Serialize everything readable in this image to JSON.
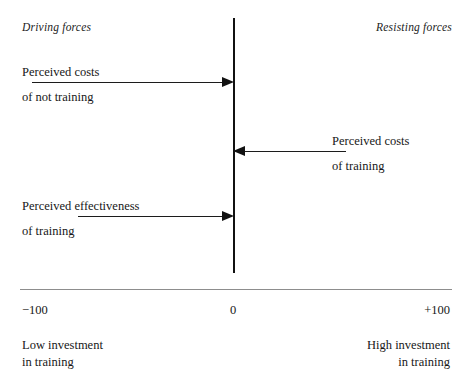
{
  "diagram": {
    "type": "force-field-analysis",
    "headings": {
      "left": "Driving forces",
      "right": "Resisting forces"
    },
    "axis": {
      "center_value": "0",
      "min_value": "−100",
      "max_value": "+100"
    },
    "forces": [
      {
        "id": "perceived-costs-of-not-training",
        "side": "driving",
        "direction": "right",
        "line1": "Perceived costs",
        "line2": "of not training"
      },
      {
        "id": "perceived-costs-of-training",
        "side": "resisting",
        "direction": "left",
        "line1": "Perceived costs",
        "line2": "of training"
      },
      {
        "id": "perceived-effectiveness-of-training",
        "side": "driving",
        "direction": "right",
        "line1": "Perceived effectiveness",
        "line2": "of training"
      }
    ],
    "captions": {
      "left_line1": "Low investment",
      "left_line2": "in training",
      "right_line1": "High investment",
      "right_line2": "in training"
    },
    "colors": {
      "axis": "#111111",
      "arrow": "#121212",
      "rule": "#8d8d8d",
      "text": "#171717",
      "background": "#ffffff"
    }
  }
}
